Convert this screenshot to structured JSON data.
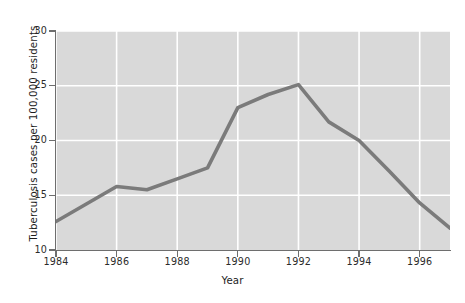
{
  "chart_data": {
    "type": "line",
    "title": "",
    "xlabel": "Year",
    "ylabel": "Tuberculosis cases per 100,000 residents",
    "x": [
      1984,
      1985,
      1986,
      1987,
      1988,
      1989,
      1990,
      1991,
      1992,
      1993,
      1994,
      1995,
      1996,
      1997
    ],
    "values": [
      12.6,
      14.2,
      15.8,
      15.5,
      16.5,
      17.5,
      23.0,
      24.2,
      25.1,
      21.7,
      20.0,
      17.2,
      14.3,
      12.0
    ],
    "series": [
      {
        "name": "Tuberculosis cases per 100,000 residents",
        "values": [
          12.6,
          14.2,
          15.8,
          15.5,
          16.5,
          17.5,
          23.0,
          24.2,
          25.1,
          21.7,
          20.0,
          17.2,
          14.3,
          12.0
        ]
      }
    ],
    "xlim": [
      1984,
      1997
    ],
    "ylim": [
      10,
      30
    ],
    "y_ticks": [
      10,
      15,
      20,
      25,
      30
    ],
    "y_tick_labels": [
      "10",
      "15",
      "20",
      "25",
      "30"
    ],
    "x_ticks": [
      1984,
      1986,
      1988,
      1990,
      1992,
      1994,
      1996
    ],
    "x_tick_labels": [
      "1984",
      "1986",
      "1988",
      "1990",
      "1992",
      "1994",
      "1996"
    ],
    "grid": true,
    "grid_color": "#ffffff",
    "legend": false,
    "legend_position": "none",
    "line_color": "#7b7b7b",
    "plot_background": "#d9d9d9",
    "figure_background": "#ffffff",
    "axis_color": "#6e6e6e"
  }
}
